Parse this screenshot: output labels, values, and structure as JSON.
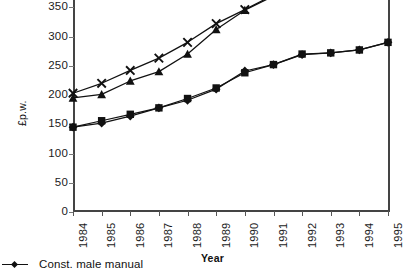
{
  "chart_data": {
    "type": "line",
    "title": "",
    "xlabel": "Year",
    "ylabel": "£p.w.",
    "categories": [
      "1984",
      "1985",
      "1986",
      "1987",
      "1988",
      "1989",
      "1990",
      "1991",
      "1992",
      "1993",
      "1994",
      "1995"
    ],
    "xlim": [
      1984,
      1995
    ],
    "ylim": [
      0,
      400
    ],
    "yticks": [
      0,
      50,
      100,
      150,
      200,
      250,
      300,
      350,
      400
    ],
    "ytick_labels": [
      "0",
      "50",
      "100",
      "150",
      "200",
      "250",
      "300",
      "350",
      "400"
    ],
    "grid": false,
    "legend_position": "below-left",
    "note": "Top of plot is cropped; the 400 tick label is clipped at the image edge.",
    "series": [
      {
        "name": "Series X (cross marker, upper)",
        "marker": "x",
        "x": [
          "1984",
          "1985",
          "1986",
          "1987",
          "1988",
          "1989",
          "1990",
          "1991",
          "1992"
        ],
        "values": [
          203,
          220,
          242,
          263,
          290,
          322,
          346,
          371,
          396
        ]
      },
      {
        "name": "Series triangle (upper)",
        "marker": "triangle",
        "x": [
          "1984",
          "1985",
          "1986",
          "1987",
          "1988",
          "1989",
          "1990",
          "1991",
          "1992"
        ],
        "values": [
          195,
          201,
          224,
          240,
          270,
          312,
          345,
          369,
          392
        ]
      },
      {
        "name": "Const. male manual",
        "marker": "diamond",
        "x": [
          "1984",
          "1985",
          "1986",
          "1987",
          "1988",
          "1989",
          "1990",
          "1991",
          "1992",
          "1993",
          "1994",
          "1995"
        ],
        "values": [
          145,
          152,
          164,
          178,
          191,
          210,
          241,
          252,
          269,
          272,
          277,
          290
        ]
      },
      {
        "name": "Series square (lower)",
        "marker": "square",
        "x": [
          "1984",
          "1985",
          "1986",
          "1987",
          "1988",
          "1989",
          "1990",
          "1991",
          "1992",
          "1993",
          "1994",
          "1995"
        ],
        "values": [
          145,
          156,
          167,
          178,
          194,
          212,
          238,
          252,
          270,
          272,
          277,
          290
        ]
      }
    ]
  },
  "axes": {
    "y_title": "£p.w.",
    "x_title": "Year",
    "ytick_labels": [
      "400",
      "350",
      "300",
      "250",
      "200",
      "150",
      "100",
      "50",
      "0"
    ],
    "xtick_labels": [
      "1984",
      "1985",
      "1986",
      "1987",
      "1988",
      "1989",
      "1990",
      "1991",
      "1992",
      "1993",
      "1994",
      "1995"
    ]
  },
  "legend": {
    "items": [
      {
        "label": "Const. male manual",
        "marker": "diamond",
        "color": "#111111"
      }
    ]
  },
  "colors": {
    "line": "#111111",
    "axis": "#444444",
    "text": "#1b1b1b",
    "background": "#ffffff"
  }
}
